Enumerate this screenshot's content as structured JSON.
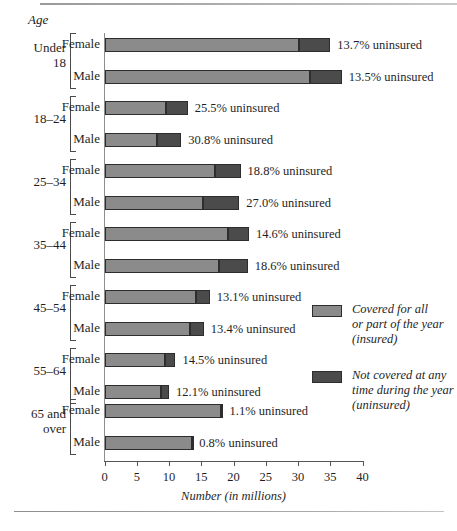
{
  "chart_data": {
    "type": "bar",
    "orientation": "horizontal",
    "stacked": true,
    "title": "",
    "xlabel": "Number (in millions)",
    "ylabel": "Age",
    "xlim": [
      0,
      40
    ],
    "xticks": [
      0,
      5,
      10,
      15,
      20,
      25,
      30,
      35,
      40
    ],
    "xtick_labels": [
      "0",
      "5",
      "10",
      "15",
      "20",
      "25",
      "30",
      "35",
      "40"
    ],
    "grid": false,
    "legend_position": "right",
    "series": [
      {
        "name": "Covered for all or part of the year (insured)",
        "color": "#8b8b8b",
        "values": [
          30.2,
          31.8,
          9.6,
          8.2,
          17.1,
          15.2,
          19.1,
          17.7,
          14.2,
          13.3,
          9.4,
          8.8,
          18.1,
          13.5
        ]
      },
      {
        "name": "Not covered at any time during the year (uninsured)",
        "color": "#4b4b4b",
        "values": [
          4.8,
          5.0,
          3.3,
          3.7,
          4.0,
          5.7,
          3.3,
          4.5,
          2.1,
          2.1,
          1.6,
          1.2,
          0.2,
          0.1
        ]
      }
    ],
    "categories": [
      "Under 18 Female",
      "Under 18 Male",
      "18-24 Female",
      "18-24 Male",
      "25-34 Female",
      "25-34 Male",
      "35-44 Female",
      "35-44 Male",
      "45-54 Female",
      "45-54 Male",
      "55-64 Female",
      "55-64 Male",
      "65 and over Female",
      "65 and over Male"
    ],
    "annotations": [
      "13.7% uninsured",
      "13.5% uninsured",
      "25.5% uninsured",
      "30.8% uninsured",
      "18.8% uninsured",
      "27.0% uninsured",
      "14.6% uninsured",
      "18.6% uninsured",
      "13.1% uninsured",
      "13.4% uninsured",
      "14.5% uninsured",
      "12.1% uninsured",
      "1.1% uninsured",
      "0.8% uninsured"
    ]
  },
  "axis": {
    "y_header": "Age",
    "x_title": "Number (in millions)",
    "ticks": [
      "0",
      "5",
      "10",
      "15",
      "20",
      "25",
      "30",
      "35",
      "40"
    ]
  },
  "groups": [
    {
      "age": "Under 18",
      "age_line1": "Under",
      "age_line2": "18",
      "rows": [
        {
          "sex": "Female",
          "insured": 30.2,
          "uninsured": 4.8,
          "note": "13.7% uninsured"
        },
        {
          "sex": "Male",
          "insured": 31.8,
          "uninsured": 5.0,
          "note": "13.5% uninsured"
        }
      ]
    },
    {
      "age": "18–24",
      "age_line1": "18–24",
      "age_line2": "",
      "rows": [
        {
          "sex": "Female",
          "insured": 9.6,
          "uninsured": 3.3,
          "note": "25.5% uninsured"
        },
        {
          "sex": "Male",
          "insured": 8.2,
          "uninsured": 3.7,
          "note": "30.8% uninsured"
        }
      ]
    },
    {
      "age": "25–34",
      "age_line1": "25–34",
      "age_line2": "",
      "rows": [
        {
          "sex": "Female",
          "insured": 17.1,
          "uninsured": 4.0,
          "note": "18.8% uninsured"
        },
        {
          "sex": "Male",
          "insured": 15.2,
          "uninsured": 5.7,
          "note": "27.0% uninsured"
        }
      ]
    },
    {
      "age": "35–44",
      "age_line1": "35–44",
      "age_line2": "",
      "rows": [
        {
          "sex": "Female",
          "insured": 19.1,
          "uninsured": 3.3,
          "note": "14.6% uninsured"
        },
        {
          "sex": "Male",
          "insured": 17.7,
          "uninsured": 4.5,
          "note": "18.6% uninsured"
        }
      ]
    },
    {
      "age": "45–54",
      "age_line1": "45–54",
      "age_line2": "",
      "rows": [
        {
          "sex": "Female",
          "insured": 14.2,
          "uninsured": 2.1,
          "note": "13.1% uninsured"
        },
        {
          "sex": "Male",
          "insured": 13.3,
          "uninsured": 2.1,
          "note": "13.4% uninsured"
        }
      ]
    },
    {
      "age": "55–64",
      "age_line1": "55–64",
      "age_line2": "",
      "rows": [
        {
          "sex": "Female",
          "insured": 9.4,
          "uninsured": 1.6,
          "note": "14.5% uninsured"
        },
        {
          "sex": "Male",
          "insured": 8.8,
          "uninsured": 1.2,
          "note": "12.1% uninsured"
        }
      ]
    },
    {
      "age": "65 and over",
      "age_line1": "65 and",
      "age_line2": "over",
      "rows": [
        {
          "sex": "Female",
          "insured": 18.1,
          "uninsured": 0.2,
          "note": "1.1% uninsured"
        },
        {
          "sex": "Male",
          "insured": 13.5,
          "uninsured": 0.1,
          "note": "0.8% uninsured"
        }
      ]
    }
  ],
  "legend": [
    {
      "swatch": "#8b8b8b",
      "lines": [
        "Covered for all",
        "or part of the year",
        "(insured)"
      ]
    },
    {
      "swatch": "#4b4b4b",
      "lines": [
        "Not covered at any",
        "time during the year",
        "(uninsured)"
      ]
    }
  ]
}
